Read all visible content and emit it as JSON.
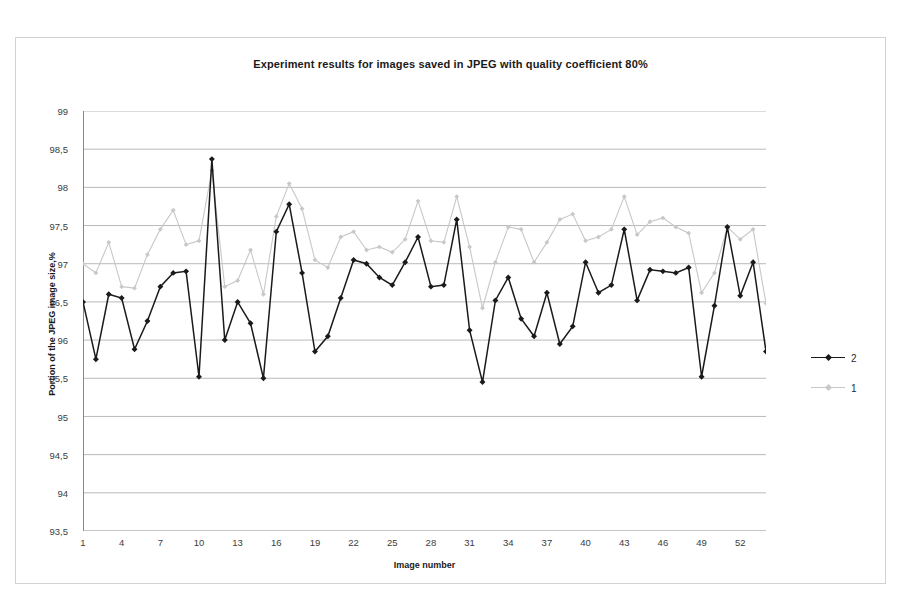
{
  "chart_data": {
    "type": "line",
    "title": "Experiment results for images saved in JPEG with quality coefficient 80%",
    "xlabel": "Image number",
    "ylabel": "Portion of the JPEG image size,%",
    "ylim": [
      93.5,
      99
    ],
    "ytick_labels": [
      "99",
      "98,5",
      "98",
      "97,5",
      "97",
      "96,5",
      "96",
      "95,5",
      "95",
      "94,5",
      "94",
      "93,5"
    ],
    "ytick_values": [
      99,
      98.5,
      98,
      97.5,
      97,
      96.5,
      96,
      95.5,
      95,
      94.5,
      94,
      93.5
    ],
    "xtick_labels": [
      "1",
      "4",
      "7",
      "10",
      "13",
      "16",
      "19",
      "22",
      "25",
      "28",
      "31",
      "34",
      "37",
      "40",
      "43",
      "46",
      "49",
      "52"
    ],
    "xtick_values": [
      1,
      4,
      7,
      10,
      13,
      16,
      19,
      22,
      25,
      28,
      31,
      34,
      37,
      40,
      43,
      46,
      49,
      52
    ],
    "xlim": [
      1,
      54
    ],
    "grid": true,
    "legend_position": "right",
    "x": [
      1,
      2,
      3,
      4,
      5,
      6,
      7,
      8,
      9,
      10,
      11,
      12,
      13,
      14,
      15,
      16,
      17,
      18,
      19,
      20,
      21,
      22,
      23,
      24,
      25,
      26,
      27,
      28,
      29,
      30,
      31,
      32,
      33,
      34,
      35,
      36,
      37,
      38,
      39,
      40,
      41,
      42,
      43,
      44,
      45,
      46,
      47,
      48,
      49,
      50,
      51,
      52,
      53,
      54
    ],
    "series": [
      {
        "name": "2",
        "color": "#1a1a1a",
        "marker": "diamond",
        "values": [
          96.5,
          95.75,
          96.6,
          96.55,
          95.88,
          96.25,
          96.7,
          96.88,
          96.9,
          95.52,
          98.37,
          96.0,
          96.5,
          96.22,
          95.5,
          97.42,
          97.78,
          96.88,
          95.85,
          96.05,
          96.55,
          97.05,
          97.0,
          96.82,
          96.72,
          97.02,
          97.35,
          96.7,
          96.72,
          97.58,
          96.13,
          95.45,
          96.52,
          96.82,
          96.28,
          96.05,
          96.62,
          95.95,
          96.18,
          97.02,
          96.62,
          96.72,
          97.45,
          96.52,
          96.92,
          96.9,
          96.88,
          96.95,
          95.52,
          96.45,
          97.48,
          96.58,
          97.02,
          95.85
        ]
      },
      {
        "name": "1",
        "color": "#c8c8c8",
        "marker": "diamond",
        "values": [
          97.0,
          96.88,
          97.28,
          96.7,
          96.68,
          97.12,
          97.45,
          97.7,
          97.25,
          97.3,
          98.22,
          96.7,
          96.78,
          97.18,
          96.6,
          97.62,
          98.05,
          97.72,
          97.05,
          96.95,
          97.35,
          97.42,
          97.18,
          97.22,
          97.15,
          97.32,
          97.82,
          97.3,
          97.28,
          97.88,
          97.22,
          96.42,
          97.02,
          97.48,
          97.45,
          97.02,
          97.28,
          97.58,
          97.65,
          97.3,
          97.35,
          97.45,
          97.88,
          97.38,
          97.55,
          97.6,
          97.48,
          97.4,
          96.62,
          96.88,
          97.48,
          97.32,
          97.45,
          96.48
        ]
      }
    ]
  }
}
